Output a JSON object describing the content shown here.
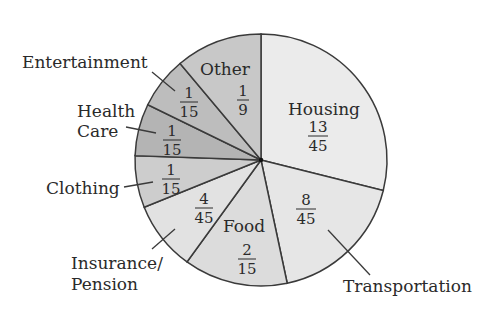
{
  "chart_data": {
    "type": "pie",
    "title": "",
    "start_angle_deg": 0,
    "direction": "clockwise from top",
    "slices": [
      {
        "name": "Housing",
        "label": "Housing",
        "fraction": "13/45",
        "value": 0.2889,
        "color": "#ebebeb"
      },
      {
        "name": "Transportation",
        "label": "Transportation",
        "fraction": "8/45",
        "value": 0.1778,
        "color": "#e6e6e6"
      },
      {
        "name": "Food",
        "label": "Food",
        "fraction": "2/15",
        "value": 0.1333,
        "color": "#dcdcdc"
      },
      {
        "name": "Insurance/Pension",
        "label": "Insurance/\nPension",
        "fraction": "4/45",
        "value": 0.0889,
        "color": "#e2e2e2"
      },
      {
        "name": "Clothing",
        "label": "Clothing",
        "fraction": "1/15",
        "value": 0.0667,
        "color": "#cdcdcd"
      },
      {
        "name": "Health Care",
        "label": "Health\nCare",
        "fraction": "1/15",
        "value": 0.0667,
        "color": "#b4b4b4"
      },
      {
        "name": "Entertainment",
        "label": "Entertainment",
        "fraction": "1/15",
        "value": 0.0667,
        "color": "#bdbdbd"
      },
      {
        "name": "Other",
        "label": "Other",
        "fraction": "1/9",
        "value": 0.1111,
        "color": "#c8c8c8"
      }
    ]
  },
  "labels": {
    "housing": "Housing",
    "housing_num": "13",
    "housing_den": "45",
    "transportation": "Transportation",
    "transportation_num": "8",
    "transportation_den": "45",
    "food": "Food",
    "food_num": "2",
    "food_den": "15",
    "insurance_1": "Insurance/",
    "insurance_2": "Pension",
    "insurance_num": "4",
    "insurance_den": "45",
    "clothing": "Clothing",
    "clothing_num": "1",
    "clothing_den": "15",
    "health_1": "Health",
    "health_2": "Care",
    "health_num": "1",
    "health_den": "15",
    "entertainment": "Entertainment",
    "entertainment_num": "1",
    "entertainment_den": "15",
    "other": "Other",
    "other_num": "1",
    "other_den": "9"
  }
}
